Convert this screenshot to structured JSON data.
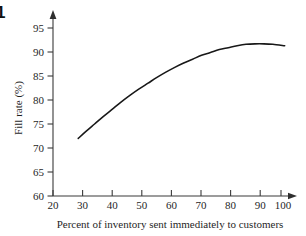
{
  "figure": {
    "number_label": "1",
    "background_color": "#ffffff",
    "line_color": "#181818",
    "axis_color": "#3a3a3a",
    "text_color": "#1f1f1f"
  },
  "chart_data": {
    "type": "line",
    "title": "",
    "subtitle": "",
    "xlabel": "Percent of inventory sent immediately to customers",
    "ylabel": "Fill rate (%)",
    "xlim": [
      20,
      100
    ],
    "ylim": [
      60,
      95
    ],
    "xticks": [
      20,
      30,
      40,
      50,
      60,
      70,
      80,
      90,
      100
    ],
    "xticklabels": [
      "20",
      "30",
      "40",
      "50",
      "60",
      "70",
      "80",
      "90",
      "100"
    ],
    "yticks": [
      60,
      65,
      70,
      75,
      80,
      85,
      90,
      95
    ],
    "yticklabels": [
      "60",
      "65",
      "70",
      "75",
      "80",
      "85",
      "90",
      "95"
    ],
    "grid": false,
    "legend": null,
    "legend_position": "none",
    "axis_arrows": {
      "x": "right",
      "y": "up"
    },
    "series": [
      {
        "name": "Fill rate",
        "color": "#181818",
        "x": [
          28.5,
          31,
          34,
          37,
          40,
          43,
          46,
          49,
          52,
          55,
          58,
          61,
          64,
          67,
          70,
          73,
          76,
          79,
          82,
          85,
          88,
          91,
          94,
          98
        ],
        "y": [
          72.0,
          73.4,
          75.0,
          76.6,
          78.1,
          79.6,
          81.0,
          82.3,
          83.5,
          84.7,
          85.8,
          86.8,
          87.7,
          88.5,
          89.3,
          89.9,
          90.5,
          90.9,
          91.3,
          91.6,
          91.7,
          91.7,
          91.6,
          91.3
        ]
      }
    ],
    "annotations": []
  }
}
